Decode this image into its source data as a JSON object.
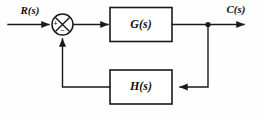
{
  "diagram": {
    "type": "control-system-block-diagram",
    "background_color": "#fefefe",
    "line_color": "#1a1a1a",
    "signals": {
      "input_label": "R(s)",
      "output_label": "C(s)"
    },
    "blocks": [
      {
        "id": "forward",
        "label": "G(s)",
        "role": "forward-path-transfer-function"
      },
      {
        "id": "feedback",
        "label": "H(s)",
        "role": "feedback-path-transfer-function"
      }
    ],
    "summing_junction": {
      "name": "summing-junction",
      "positive_sign": "+",
      "negative_sign": "−",
      "positive_input": "R(s)",
      "negative_input": "H(s) output"
    },
    "nodes": [
      {
        "id": "takeoff",
        "label": "",
        "role": "output-takeoff-node"
      }
    ],
    "connections": [
      {
        "from": "R(s)",
        "to": "summing-junction",
        "sign": "+"
      },
      {
        "from": "summing-junction",
        "to": "G(s)",
        "sign": ""
      },
      {
        "from": "G(s)",
        "to": "takeoff-node",
        "sign": ""
      },
      {
        "from": "takeoff-node",
        "to": "C(s)",
        "sign": ""
      },
      {
        "from": "takeoff-node",
        "to": "H(s)",
        "sign": ""
      },
      {
        "from": "H(s)",
        "to": "summing-junction",
        "sign": "−"
      }
    ]
  }
}
